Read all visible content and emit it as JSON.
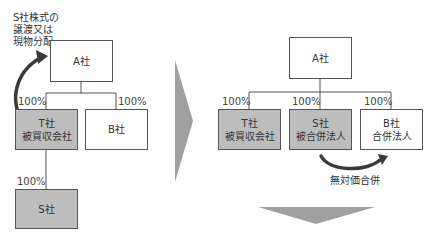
{
  "before": {
    "note_lines": [
      "S社株式の",
      "譲渡又は",
      "現物分配"
    ],
    "company_a": "A社",
    "company_t": {
      "line1": "T社",
      "line2": "被買収会社"
    },
    "company_b": "B社",
    "company_s": "S社",
    "pct_t": "100%",
    "pct_b": "100%",
    "pct_s": "100%"
  },
  "after": {
    "company_a": "A社",
    "company_t": {
      "line1": "T社",
      "line2": "被買収会社"
    },
    "company_s": {
      "line1": "S社",
      "line2": "被合併法人"
    },
    "company_b": {
      "line1": "B社",
      "line2": "合併法人"
    },
    "pct_t": "100%",
    "pct_s": "100%",
    "pct_b": "100%",
    "merger_label": "無対価合併"
  },
  "colors": {
    "gray_box": "#bdbdbd",
    "arrow": "#9e9e9e",
    "line": "#555555",
    "curve_arrow": "#3a3a3a"
  }
}
